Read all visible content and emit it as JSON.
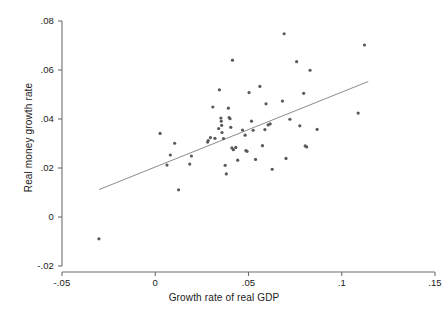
{
  "chart_data": {
    "type": "scatter",
    "title": "",
    "xlabel": "Growth rate of real GDP",
    "ylabel": "Real money growth rate",
    "xlim": [
      -0.05,
      0.15
    ],
    "ylim": [
      -0.02,
      0.08
    ],
    "xticks": [
      -0.05,
      0,
      0.05,
      0.1,
      0.15
    ],
    "xtick_labels": [
      "-.05",
      "0",
      ".05",
      ".1",
      ".15"
    ],
    "yticks": [
      -0.02,
      0,
      0.02,
      0.04,
      0.06,
      0.08
    ],
    "ytick_labels": [
      "-.02",
      "0",
      ".02",
      ".04",
      ".06",
      ".08"
    ],
    "grid": false,
    "legend": "none",
    "marker_color": "#595959",
    "marker_size": 3.2,
    "line_color": "#8c8c8c",
    "axis_color": "#6e6e6e",
    "series": [
      {
        "name": "Countries",
        "type": "scatter",
        "points": [
          [
            -0.0302,
            -0.0089
          ],
          [
            0.0026,
            0.0341
          ],
          [
            0.0063,
            0.0212
          ],
          [
            0.0081,
            0.0253
          ],
          [
            0.0104,
            0.0301
          ],
          [
            0.0125,
            0.0111
          ],
          [
            0.0185,
            0.0216
          ],
          [
            0.0194,
            0.0249
          ],
          [
            0.0281,
            0.0306
          ],
          [
            0.0284,
            0.0312
          ],
          [
            0.0296,
            0.0324
          ],
          [
            0.0309,
            0.0449
          ],
          [
            0.032,
            0.0321
          ],
          [
            0.034,
            0.0361
          ],
          [
            0.0344,
            0.0519
          ],
          [
            0.0352,
            0.0404
          ],
          [
            0.0354,
            0.0391
          ],
          [
            0.0356,
            0.0374
          ],
          [
            0.0358,
            0.0345
          ],
          [
            0.0366,
            0.032
          ],
          [
            0.0375,
            0.0211
          ],
          [
            0.0381,
            0.0176
          ],
          [
            0.0392,
            0.0444
          ],
          [
            0.0396,
            0.0406
          ],
          [
            0.0401,
            0.0401
          ],
          [
            0.0405,
            0.0366
          ],
          [
            0.0411,
            0.0282
          ],
          [
            0.0414,
            0.064
          ],
          [
            0.0419,
            0.0275
          ],
          [
            0.0432,
            0.0284
          ],
          [
            0.0442,
            0.0232
          ],
          [
            0.0468,
            0.0355
          ],
          [
            0.0482,
            0.0334
          ],
          [
            0.0486,
            0.0271
          ],
          [
            0.0492,
            0.0268
          ],
          [
            0.0503,
            0.0508
          ],
          [
            0.0516,
            0.0391
          ],
          [
            0.0525,
            0.0354
          ],
          [
            0.0538,
            0.0235
          ],
          [
            0.0561,
            0.0533
          ],
          [
            0.0575,
            0.0291
          ],
          [
            0.0588,
            0.0357
          ],
          [
            0.0594,
            0.0462
          ],
          [
            0.0605,
            0.0376
          ],
          [
            0.0616,
            0.038
          ],
          [
            0.0627,
            0.0195
          ],
          [
            0.0682,
            0.0473
          ],
          [
            0.0691,
            0.0748
          ],
          [
            0.0701,
            0.0239
          ],
          [
            0.0722,
            0.0399
          ],
          [
            0.0758,
            0.0634
          ],
          [
            0.0775,
            0.0372
          ],
          [
            0.0796,
            0.0505
          ],
          [
            0.0804,
            0.029
          ],
          [
            0.0812,
            0.0286
          ],
          [
            0.083,
            0.0599
          ],
          [
            0.0868,
            0.0358
          ],
          [
            0.1088,
            0.0424
          ],
          [
            0.1122,
            0.0702
          ]
        ]
      },
      {
        "name": "Fitted regression line",
        "type": "line",
        "endpoints": [
          [
            -0.0301,
            0.0112
          ],
          [
            0.1142,
            0.0553
          ]
        ]
      }
    ]
  }
}
